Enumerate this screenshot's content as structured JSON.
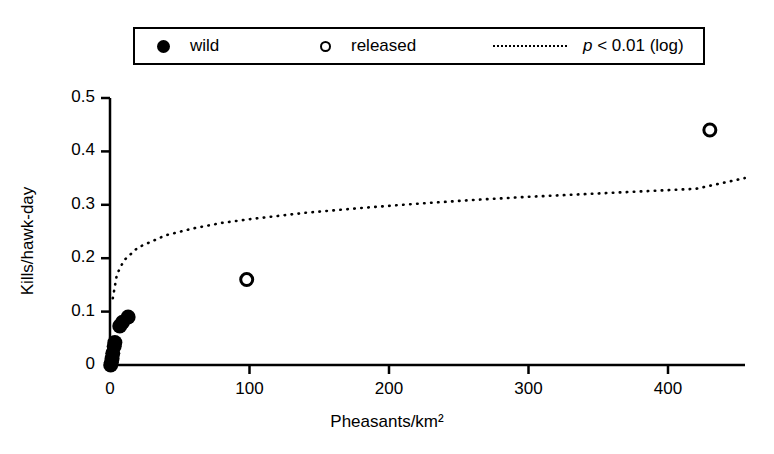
{
  "legend": {
    "items": [
      {
        "label": "wild",
        "marker": "filled-circle-icon"
      },
      {
        "label": "released",
        "marker": "open-circle-icon"
      },
      {
        "label_prefix": "p",
        "label_rest": " < 0.01 (log)",
        "marker": "dotted-line-icon"
      }
    ]
  },
  "chart_data": {
    "type": "scatter",
    "title": "",
    "xlabel": "Pheasants/km²",
    "ylabel": "Kills/hawk-day",
    "xlim": [
      0,
      455
    ],
    "ylim": [
      0,
      0.5
    ],
    "xticks": [
      0,
      100,
      200,
      300,
      400
    ],
    "xtick_labels": [
      "0",
      "100",
      "200",
      "300",
      "400"
    ],
    "yticks": [
      0,
      0.1,
      0.2,
      0.3,
      0.4,
      0.5
    ],
    "ytick_labels": [
      "0",
      "0.1",
      "0.2",
      "0.3",
      "0.4",
      "0.5"
    ],
    "grid": false,
    "legend_position": "top-center",
    "series": [
      {
        "name": "wild",
        "marker": "filled-circle",
        "points": [
          {
            "x": 0.5,
            "y": 0.0
          },
          {
            "x": 1.0,
            "y": 0.005
          },
          {
            "x": 1.5,
            "y": 0.012
          },
          {
            "x": 2.0,
            "y": 0.022
          },
          {
            "x": 3.0,
            "y": 0.035
          },
          {
            "x": 3.5,
            "y": 0.042
          },
          {
            "x": 7.0,
            "y": 0.073
          },
          {
            "x": 9.0,
            "y": 0.08
          },
          {
            "x": 13.0,
            "y": 0.09
          }
        ]
      },
      {
        "name": "released",
        "marker": "open-circle",
        "points": [
          {
            "x": 98,
            "y": 0.16
          },
          {
            "x": 430,
            "y": 0.44
          }
        ]
      }
    ],
    "fit_curve": {
      "name": "p < 0.01 (log)",
      "style": "dotted",
      "form": "logarithmic",
      "points": [
        {
          "x": 2,
          "y": 0.125
        },
        {
          "x": 5,
          "y": 0.17
        },
        {
          "x": 10,
          "y": 0.196
        },
        {
          "x": 20,
          "y": 0.22
        },
        {
          "x": 40,
          "y": 0.243
        },
        {
          "x": 60,
          "y": 0.256
        },
        {
          "x": 80,
          "y": 0.266
        },
        {
          "x": 100,
          "y": 0.273
        },
        {
          "x": 140,
          "y": 0.285
        },
        {
          "x": 180,
          "y": 0.294
        },
        {
          "x": 220,
          "y": 0.302
        },
        {
          "x": 260,
          "y": 0.309
        },
        {
          "x": 300,
          "y": 0.315
        },
        {
          "x": 340,
          "y": 0.32
        },
        {
          "x": 380,
          "y": 0.325
        },
        {
          "x": 420,
          "y": 0.33
        },
        {
          "x": 455,
          "y": 0.35
        }
      ]
    }
  }
}
